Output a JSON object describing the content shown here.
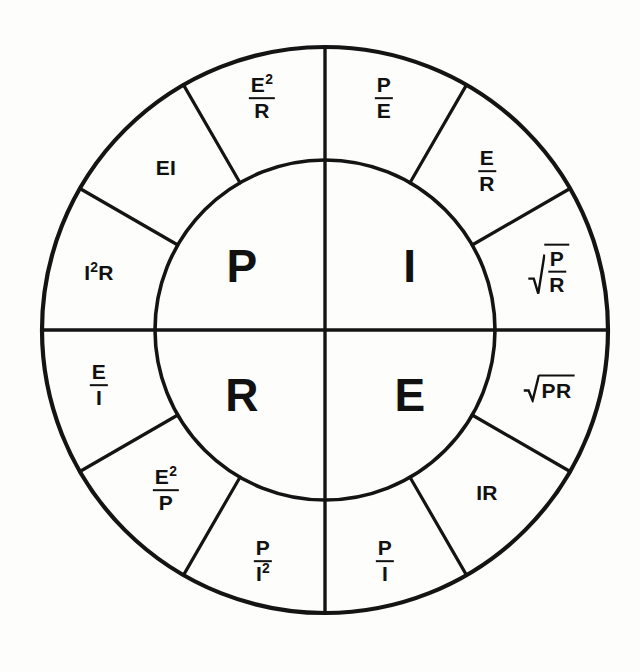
{
  "diagram": {
    "name": "ohms-law-power-wheel",
    "background_color": "#fdfdfc",
    "line_color": "#141414",
    "text_color": "#111111",
    "geometry": {
      "center_x": 325,
      "center_y": 330,
      "inner_radius": 170,
      "outer_radius": 283,
      "sector_span_degrees": 30,
      "quadrant_count": 4,
      "outer_segments_per_quadrant": 3
    }
  },
  "core": {
    "quadrants": [
      {
        "id": "core-p",
        "label": "P",
        "position": "top-left",
        "x": 242,
        "y": 266
      },
      {
        "id": "core-i",
        "label": "I",
        "position": "top-right",
        "x": 410,
        "y": 266
      },
      {
        "id": "core-r",
        "label": "R",
        "position": "bottom-left",
        "x": 242,
        "y": 395
      },
      {
        "id": "core-e",
        "label": "E",
        "position": "bottom-right",
        "x": 410,
        "y": 395
      }
    ]
  },
  "ring": {
    "segments": [
      {
        "id": "seg-p-e2r",
        "group": "P",
        "order": 1,
        "type": "fraction",
        "numerator": "E",
        "numerator_exponent": "2",
        "denominator": "R",
        "text": "E²/R",
        "x": 262,
        "y": 98,
        "rotate": 0
      },
      {
        "id": "seg-p-ei",
        "group": "P",
        "order": 2,
        "type": "plain",
        "text": "EI",
        "x": 166,
        "y": 167,
        "rotate": 0
      },
      {
        "id": "seg-p-i2r",
        "group": "P",
        "order": 3,
        "type": "plain-exponent",
        "base": "I",
        "exponent": "2",
        "tail": "R",
        "text": "I²R",
        "x": 99,
        "y": 272,
        "rotate": 0
      },
      {
        "id": "seg-i-pe",
        "group": "I",
        "order": 1,
        "type": "fraction",
        "numerator": "P",
        "denominator": "E",
        "text": "P/E",
        "x": 384,
        "y": 98,
        "rotate": 0
      },
      {
        "id": "seg-i-er",
        "group": "I",
        "order": 2,
        "type": "fraction",
        "numerator": "E",
        "denominator": "R",
        "text": "E/R",
        "x": 487,
        "y": 171,
        "rotate": 0
      },
      {
        "id": "seg-i-sqrt-p-over-r",
        "group": "I",
        "order": 3,
        "type": "radical-fraction",
        "numerator": "P",
        "denominator": "R",
        "text": "√(P/R)",
        "x": 549,
        "y": 271,
        "rotate": 0
      },
      {
        "id": "seg-e-sqrt-pr",
        "group": "E",
        "order": 1,
        "type": "radical-plain",
        "radicand": "PR",
        "text": "√(PR)",
        "x": 549,
        "y": 390,
        "rotate": 0
      },
      {
        "id": "seg-e-ir",
        "group": "E",
        "order": 2,
        "type": "plain",
        "text": "IR",
        "x": 487,
        "y": 492,
        "rotate": 0
      },
      {
        "id": "seg-e-pi",
        "group": "E",
        "order": 3,
        "type": "fraction",
        "numerator": "P",
        "denominator": "I",
        "text": "P/I",
        "x": 385,
        "y": 561,
        "rotate": 0
      },
      {
        "id": "seg-r-pi2",
        "group": "R",
        "order": 1,
        "type": "fraction",
        "numerator": "P",
        "denominator": "I",
        "denominator_exponent": "2",
        "text": "P/I²",
        "x": 263,
        "y": 561,
        "rotate": 0
      },
      {
        "id": "seg-r-e2p",
        "group": "R",
        "order": 2,
        "type": "fraction",
        "numerator": "E",
        "numerator_exponent": "2",
        "denominator": "P",
        "text": "E²/P",
        "x": 166,
        "y": 490,
        "rotate": 0
      },
      {
        "id": "seg-r-ei-frac",
        "group": "R",
        "order": 3,
        "type": "fraction",
        "numerator": "E",
        "denominator": "I",
        "text": "E/I",
        "x": 99,
        "y": 385,
        "rotate": 0
      }
    ]
  }
}
